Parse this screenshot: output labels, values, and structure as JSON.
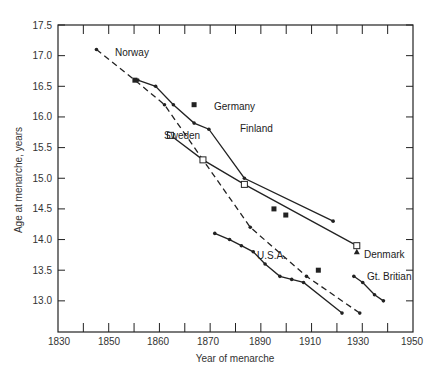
{
  "chart_data": {
    "type": "line",
    "title": "",
    "xlabel": "Year of menarche",
    "ylabel": "Age at menarche, years",
    "xlim": [
      1830,
      1950
    ],
    "ylim": [
      12.5,
      17.5
    ],
    "x_ticks": [
      "1830",
      "1850",
      "1860",
      "1870",
      "1890",
      "1910",
      "1930",
      "1950"
    ],
    "y_ticks": [
      "13.0",
      "13.5",
      "14.0",
      "14.5",
      "15.0",
      "15.5",
      "16.0",
      "16.5",
      "17.0",
      "17.5"
    ],
    "grid": false,
    "legend": "inline labels",
    "series": [
      {
        "name": "Norway",
        "style": "dashed",
        "marker": "dot",
        "x": [
          1843,
          1856,
          1866,
          1879,
          1895,
          1914,
          1932
        ],
        "y": [
          17.1,
          16.6,
          16.2,
          15.3,
          14.2,
          13.4,
          12.8
        ]
      },
      {
        "name": "Finland",
        "style": "solid",
        "marker": "dot",
        "x": [
          1857,
          1863,
          1869,
          1876,
          1881,
          1893,
          1923
        ],
        "y": [
          16.6,
          16.5,
          16.2,
          15.9,
          15.8,
          15.0,
          14.3
        ]
      },
      {
        "name": "Sweden",
        "style": "solid",
        "marker": "open-square",
        "x": [
          1868,
          1879,
          1893,
          1931
        ],
        "y": [
          15.7,
          15.3,
          14.9,
          13.9
        ]
      },
      {
        "name": "Germany",
        "style": "points",
        "marker": "filled-square",
        "x": [
          1856,
          1876,
          1903,
          1907,
          1918
        ],
        "y": [
          16.6,
          16.2,
          14.5,
          14.4,
          13.5
        ]
      },
      {
        "name": "Denmark",
        "style": "points",
        "marker": "triangle",
        "x": [
          1931
        ],
        "y": [
          13.8
        ]
      },
      {
        "name": "Gt. Britian",
        "style": "solid",
        "marker": "dot",
        "x": [
          1930,
          1933,
          1937,
          1940
        ],
        "y": [
          13.4,
          13.3,
          13.1,
          13.0
        ]
      },
      {
        "name": "U.S.A.",
        "style": "solid",
        "marker": "dot",
        "x": [
          1883,
          1888,
          1892,
          1896,
          1900,
          1905,
          1909,
          1913,
          1926
        ],
        "y": [
          14.1,
          14.0,
          13.9,
          13.8,
          13.6,
          13.4,
          13.35,
          13.3,
          12.8
        ]
      }
    ]
  },
  "labels": {
    "norway": "Norway",
    "germany": "Germany",
    "finland": "Finland",
    "sweden": "Sweden",
    "usa": "U.S.A.",
    "denmark": "Denmark",
    "britain": "Gt. Britian"
  }
}
